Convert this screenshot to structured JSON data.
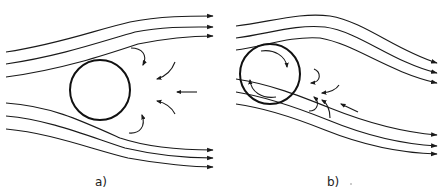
{
  "figure": {
    "title_fragment": "",
    "panels": [
      {
        "id": "a",
        "label": "a)",
        "description": "Flow past a stationary cylinder with symmetric wake vortices",
        "cylinder": {
          "cx": 100,
          "cy": 90,
          "r": 30,
          "rotating": false
        }
      },
      {
        "id": "b",
        "label": "b)",
        "description": "Flow past a rotating cylinder (clockwise) with asymmetric streamlines and wake",
        "cylinder": {
          "cx": 270,
          "cy": 74,
          "r": 30,
          "rotating": true,
          "rotation": "clockwise"
        }
      }
    ],
    "colors": {
      "ink": "#1a1a1a",
      "background": "#ffffff"
    }
  }
}
